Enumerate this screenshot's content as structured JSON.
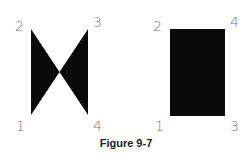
{
  "figure": {
    "caption": "Figure 9-7",
    "fill_color": "#0a0a0a",
    "label_color": "#777777",
    "shapes": [
      {
        "name": "bowtie",
        "description": "Self-intersecting quadrilateral (vertex order 1-2-3-4 crosses)",
        "vertices": [
          {
            "label": "1",
            "x": 31,
            "y": 115
          },
          {
            "label": "2",
            "x": 31,
            "y": 29
          },
          {
            "label": "3",
            "x": 88,
            "y": 29
          },
          {
            "label": "4",
            "x": 88,
            "y": 115
          }
        ]
      },
      {
        "name": "rectangle",
        "description": "Filled quadrilateral (vertex order 1-2-4-3)",
        "vertices": [
          {
            "label": "1",
            "x": 170,
            "y": 116
          },
          {
            "label": "2",
            "x": 170,
            "y": 29
          },
          {
            "label": "4",
            "x": 225,
            "y": 29
          },
          {
            "label": "3",
            "x": 225,
            "y": 116
          }
        ]
      }
    ],
    "labels": {
      "left": {
        "v1": "1",
        "v2": "2",
        "v3": "3",
        "v4": "4"
      },
      "right": {
        "v1": "1",
        "v2": "2",
        "v3": "3",
        "v4": "4"
      }
    }
  }
}
